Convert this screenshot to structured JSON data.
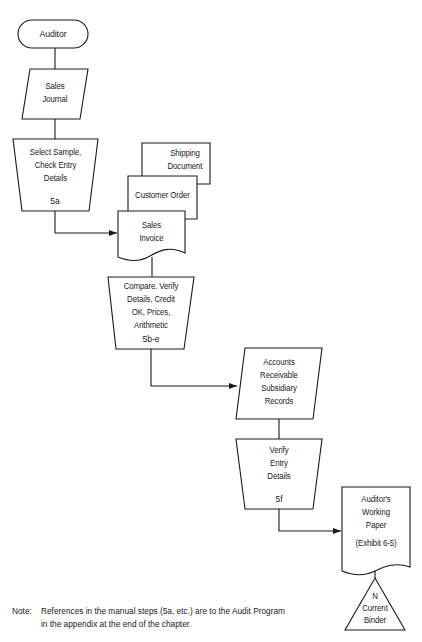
{
  "diagram": {
    "type": "audit-flowchart",
    "nodes": [
      {
        "id": "auditor",
        "shape": "terminal",
        "label": "Auditor"
      },
      {
        "id": "sales_journal",
        "shape": "input-output",
        "label_lines": [
          "Sales",
          "Journal"
        ]
      },
      {
        "id": "select_sample",
        "shape": "manual-operation",
        "label_lines": [
          "Select Sample,",
          "Check Entry",
          "Details"
        ],
        "step": "5a"
      },
      {
        "id": "shipping_document",
        "shape": "document",
        "label_lines": [
          "Shipping",
          "Document"
        ]
      },
      {
        "id": "customer_order",
        "shape": "document",
        "label_lines": [
          "Customer Order"
        ]
      },
      {
        "id": "sales_invoice",
        "shape": "document",
        "label_lines": [
          "Sales",
          "Invoice"
        ]
      },
      {
        "id": "compare_verify",
        "shape": "manual-operation",
        "label_lines": [
          "Compare. Verify",
          "Details, Credit",
          "OK, Prices,",
          "Arithmetic"
        ],
        "step": "5b-e"
      },
      {
        "id": "ar_records",
        "shape": "input-output",
        "label_lines": [
          "Accounts",
          "Receivable",
          "Subsidiary",
          "Records"
        ]
      },
      {
        "id": "verify_entry",
        "shape": "manual-operation",
        "label_lines": [
          "Verify",
          "Entry",
          "Details"
        ],
        "step": "5f"
      },
      {
        "id": "working_paper",
        "shape": "document",
        "label_lines": [
          "Auditor's",
          "Working",
          "Paper",
          "(Exhibit 6-5)"
        ]
      },
      {
        "id": "current_binder",
        "shape": "offline-storage",
        "label_lines": [
          "N",
          "Current",
          "Binder"
        ]
      }
    ],
    "edges": [
      {
        "from": "auditor",
        "to": "sales_journal"
      },
      {
        "from": "sales_journal",
        "to": "select_sample"
      },
      {
        "from": "select_sample",
        "to": "sales_invoice",
        "arrow": true
      },
      {
        "from": "sales_invoice",
        "to": "compare_verify"
      },
      {
        "from": "compare_verify",
        "to": "ar_records",
        "arrow": true
      },
      {
        "from": "ar_records",
        "to": "verify_entry"
      },
      {
        "from": "verify_entry",
        "to": "working_paper",
        "arrow": true
      },
      {
        "from": "working_paper",
        "to": "current_binder"
      }
    ]
  },
  "note": {
    "prefix": "Note:",
    "line1": "References in the manual steps (5a, etc.) are to the Audit Program",
    "line2": "in the appendix at the end of the chapter."
  },
  "colors": {
    "stroke": "#1a1a1a",
    "background": "#ffffff"
  }
}
